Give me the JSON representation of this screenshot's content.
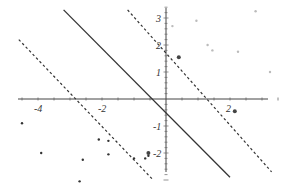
{
  "chart_data": {
    "type": "scatter",
    "title": "",
    "xlabel": "",
    "ylabel": "",
    "xlim": [
      -4.6,
      3.7
    ],
    "ylim": [
      -3.1,
      3.6
    ],
    "grid": false,
    "legend": "none",
    "x_ticks": [
      "-4",
      "-2",
      "2"
    ],
    "y_ticks": [
      "3",
      "2",
      "1",
      "-1",
      "-2"
    ],
    "series": [
      {
        "name": "class_positive",
        "color": "#bbbbbb",
        "points": [
          [
            0.2,
            2.7
          ],
          [
            0.95,
            2.9
          ],
          [
            1.3,
            2.0
          ],
          [
            1.45,
            1.8
          ],
          [
            2.25,
            1.75
          ],
          [
            2.8,
            3.25
          ],
          [
            3.25,
            1.0
          ]
        ]
      },
      {
        "name": "class_negative",
        "color": "#333333",
        "points": [
          [
            -4.5,
            -0.9
          ],
          [
            -3.9,
            -2.0
          ],
          [
            -2.7,
            -3.05
          ],
          [
            -2.6,
            -2.25
          ],
          [
            -2.1,
            -1.5
          ],
          [
            -1.8,
            -1.55
          ],
          [
            -1.8,
            -2.05
          ],
          [
            -1.0,
            -2.2
          ],
          [
            -0.65,
            -2.2
          ],
          [
            -0.55,
            -2.1
          ]
        ]
      }
    ],
    "lines": [
      {
        "name": "decision-boundary",
        "style": "solid",
        "from": [
          -3.2,
          3.3
        ],
        "to": [
          2.0,
          -2.9
        ]
      },
      {
        "name": "margin-upper",
        "style": "dashed",
        "from": [
          -1.2,
          3.3
        ],
        "to": [
          3.3,
          -2.7
        ]
      },
      {
        "name": "margin-lower",
        "style": "dashed",
        "from": [
          -4.6,
          2.2
        ],
        "to": [
          -0.4,
          -3.0
        ]
      }
    ],
    "support_vectors": [
      [
        0.4,
        1.55
      ],
      [
        2.15,
        -0.45
      ],
      [
        -0.55,
        -2.0
      ]
    ]
  },
  "axis": {
    "x_labels": [
      "-4",
      "-2",
      "2"
    ],
    "y_labels": [
      "3",
      "2",
      "1",
      "-1",
      "-2"
    ]
  }
}
